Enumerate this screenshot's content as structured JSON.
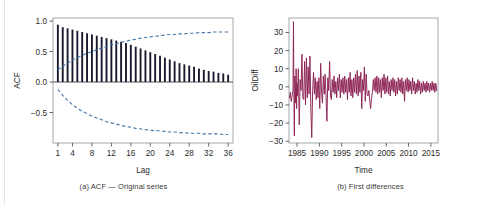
{
  "figure": {
    "panel_a_caption": "(a) ACF — Original series",
    "panel_b_caption": "(b) First differences"
  },
  "colors": {
    "bar": "#1a1a2e",
    "confidence_band": "#4477aa",
    "series_line": "#8b2252",
    "axis": "#555555",
    "frame": "#9aa0a6",
    "text": "#2b2b2b"
  },
  "chart_data": [
    {
      "type": "bar",
      "title": "",
      "subtitle": "",
      "xlabel": "Lag",
      "ylabel": "ACF",
      "xlim": [
        0,
        37
      ],
      "ylim": [
        -1.0,
        1.05
      ],
      "grid": false,
      "legend": null,
      "xticks": [
        1,
        4,
        8,
        12,
        16,
        20,
        24,
        28,
        32,
        36
      ],
      "xtick_labels": [
        "1",
        "4",
        "8",
        "12",
        "16",
        "20",
        "24",
        "28",
        "32",
        "36"
      ],
      "yticks": [
        1.0,
        0.5,
        0.0,
        -0.5
      ],
      "ytick_labels": [
        "1.0",
        "0.5",
        "0.0",
        "-0.5"
      ],
      "categories": [
        1,
        2,
        3,
        4,
        5,
        6,
        7,
        8,
        9,
        10,
        11,
        12,
        13,
        14,
        15,
        16,
        17,
        18,
        19,
        20,
        21,
        22,
        23,
        24,
        25,
        26,
        27,
        28,
        29,
        30,
        31,
        32,
        33,
        34,
        35,
        36
      ],
      "values": [
        0.94,
        0.9,
        0.88,
        0.86,
        0.84,
        0.82,
        0.8,
        0.78,
        0.76,
        0.74,
        0.72,
        0.7,
        0.68,
        0.66,
        0.64,
        0.61,
        0.58,
        0.55,
        0.52,
        0.49,
        0.46,
        0.43,
        0.4,
        0.37,
        0.34,
        0.31,
        0.29,
        0.27,
        0.25,
        0.22,
        0.2,
        0.18,
        0.17,
        0.15,
        0.14,
        0.12
      ],
      "annotations": [
        {
          "name": "upper-confidence-band",
          "style": "dashed",
          "x": [
            1,
            2,
            3,
            4,
            5,
            6,
            7,
            8,
            9,
            10,
            11,
            12,
            13,
            14,
            15,
            16,
            17,
            18,
            19,
            20,
            21,
            22,
            23,
            24,
            25,
            26,
            27,
            28,
            29,
            30,
            31,
            32,
            33,
            34,
            35,
            36
          ],
          "y": [
            0.2,
            0.26,
            0.31,
            0.36,
            0.4,
            0.44,
            0.47,
            0.5,
            0.53,
            0.56,
            0.58,
            0.61,
            0.63,
            0.65,
            0.67,
            0.69,
            0.7,
            0.72,
            0.73,
            0.74,
            0.75,
            0.76,
            0.77,
            0.78,
            0.78,
            0.79,
            0.79,
            0.8,
            0.8,
            0.81,
            0.81,
            0.81,
            0.82,
            0.82,
            0.82,
            0.82
          ]
        },
        {
          "name": "lower-confidence-band",
          "style": "dashed",
          "x": [
            1,
            2,
            3,
            4,
            5,
            6,
            7,
            8,
            9,
            10,
            11,
            12,
            13,
            14,
            15,
            16,
            17,
            18,
            19,
            20,
            21,
            22,
            23,
            24,
            25,
            26,
            27,
            28,
            29,
            30,
            31,
            32,
            33,
            34,
            35,
            36
          ],
          "y": [
            -0.12,
            -0.22,
            -0.3,
            -0.37,
            -0.43,
            -0.48,
            -0.52,
            -0.56,
            -0.59,
            -0.62,
            -0.65,
            -0.67,
            -0.69,
            -0.71,
            -0.73,
            -0.74,
            -0.76,
            -0.77,
            -0.78,
            -0.79,
            -0.8,
            -0.8,
            -0.81,
            -0.82,
            -0.82,
            -0.83,
            -0.83,
            -0.84,
            -0.84,
            -0.84,
            -0.85,
            -0.85,
            -0.85,
            -0.85,
            -0.86,
            -0.86
          ]
        },
        {
          "name": "zero-line",
          "style": "solid",
          "y": 0.0
        }
      ]
    },
    {
      "type": "line",
      "title": "",
      "subtitle": "",
      "xlabel": "Time",
      "ylabel": "OilDiff",
      "xlim": [
        1983.2,
        2016.6
      ],
      "ylim": [
        -31,
        38
      ],
      "grid": false,
      "legend": null,
      "xticks": [
        1985,
        1990,
        1995,
        2000,
        2005,
        2010,
        2015
      ],
      "xtick_labels": [
        "1985",
        "1990",
        "1995",
        "2000",
        "2005",
        "2010",
        "2015"
      ],
      "yticks": [
        30,
        20,
        10,
        0,
        -10,
        -20,
        -30
      ],
      "ytick_labels": [
        "30",
        "20",
        "10",
        "0",
        "-10",
        "-20",
        "-30"
      ],
      "x": [
        1983.3,
        1983.5,
        1983.7,
        1983.9,
        1984.1,
        1984.2,
        1984.3,
        1984.4,
        1984.5,
        1984.6,
        1984.7,
        1984.8,
        1984.9,
        1985.0,
        1985.1,
        1985.3,
        1985.5,
        1985.7,
        1985.9,
        1986.1,
        1986.3,
        1986.5,
        1986.7,
        1986.9,
        1987.1,
        1987.3,
        1987.5,
        1987.7,
        1987.9,
        1988.1,
        1988.3,
        1988.5,
        1988.7,
        1988.9,
        1989.1,
        1989.3,
        1989.5,
        1989.7,
        1989.9,
        1990.1,
        1990.3,
        1990.5,
        1990.7,
        1990.9,
        1991.1,
        1991.3,
        1991.5,
        1991.7,
        1991.9,
        1992.1,
        1992.3,
        1992.5,
        1992.7,
        1992.9,
        1993.1,
        1993.3,
        1993.5,
        1993.7,
        1993.9,
        1994.1,
        1994.3,
        1994.5,
        1994.7,
        1994.9,
        1995.1,
        1995.3,
        1995.5,
        1995.7,
        1995.9,
        1996.1,
        1996.3,
        1996.5,
        1996.7,
        1996.9,
        1997.1,
        1997.3,
        1997.5,
        1997.7,
        1997.9,
        1998.1,
        1998.3,
        1998.5,
        1998.7,
        1998.9,
        1999.1,
        1999.3,
        1999.5,
        1999.7,
        1999.9,
        2000.1,
        2000.3,
        2000.5,
        2000.7,
        2000.9,
        2001.1,
        2001.3,
        2001.5,
        2001.7,
        2001.9,
        2002.1,
        2002.3,
        2002.5,
        2002.7,
        2002.9,
        2003.1,
        2003.3,
        2003.5,
        2003.7,
        2003.9,
        2004.1,
        2004.3,
        2004.5,
        2004.7,
        2004.9,
        2005.1,
        2005.3,
        2005.5,
        2005.7,
        2005.9,
        2006.1,
        2006.3,
        2006.5,
        2006.7,
        2006.9,
        2007.1,
        2007.3,
        2007.5,
        2007.7,
        2007.9,
        2008.1,
        2008.3,
        2008.5,
        2008.7,
        2008.9,
        2009.1,
        2009.3,
        2009.5,
        2009.7,
        2009.9,
        2010.1,
        2010.3,
        2010.5,
        2010.7,
        2010.9,
        2011.1,
        2011.3,
        2011.5,
        2011.7,
        2011.9,
        2012.1,
        2012.3,
        2012.5,
        2012.7,
        2012.9,
        2013.1,
        2013.3,
        2013.5,
        2013.7,
        2013.9,
        2014.1,
        2014.3,
        2014.5,
        2014.7,
        2014.9,
        2015.1,
        2015.3,
        2015.5,
        2015.7,
        2015.9,
        2016.1,
        2016.3
      ],
      "values": [
        -6,
        -3,
        -8,
        -5,
        -2,
        36,
        -3,
        -27,
        6,
        2,
        -9,
        10,
        -12,
        2,
        -5,
        10,
        -21,
        4,
        -2,
        18,
        -6,
        -7,
        14,
        -10,
        16,
        -6,
        11,
        -4,
        17,
        -13,
        -28,
        -2,
        8,
        -4,
        5,
        -7,
        3,
        -6,
        5,
        -12,
        13,
        -3,
        -9,
        6,
        -4,
        7,
        -5,
        -19,
        5,
        -2,
        14,
        -5,
        -7,
        4,
        -3,
        6,
        -4,
        3,
        -6,
        5,
        -2,
        7,
        -6,
        4,
        -3,
        5,
        -4,
        6,
        -3,
        4,
        -7,
        5,
        -3,
        8,
        -5,
        4,
        -6,
        5,
        -3,
        7,
        -4,
        9,
        -5,
        6,
        -3,
        8,
        -12,
        4,
        -2,
        11,
        -8,
        7,
        -4,
        -5,
        -2,
        -8,
        -12,
        -6,
        -3,
        4,
        -2,
        5,
        -3,
        6,
        -4,
        5,
        -3,
        4,
        -6,
        5,
        -2,
        7,
        -4,
        5,
        -3,
        6,
        -4,
        3,
        -5,
        4,
        -2,
        5,
        -3,
        4,
        -5,
        3,
        -4,
        5,
        -2,
        4,
        -3,
        5,
        -4,
        3,
        -8,
        4,
        -2,
        5,
        -3,
        4,
        -2,
        3,
        -4,
        5,
        -2,
        3,
        -4,
        2,
        -3,
        4,
        -2,
        3,
        -4,
        2,
        -3,
        3,
        -2,
        2,
        -3,
        3,
        -2,
        2,
        -3,
        2,
        -2,
        3,
        -2,
        2,
        -3,
        2,
        -2,
        3,
        -2,
        2,
        -1
      ]
    }
  ]
}
